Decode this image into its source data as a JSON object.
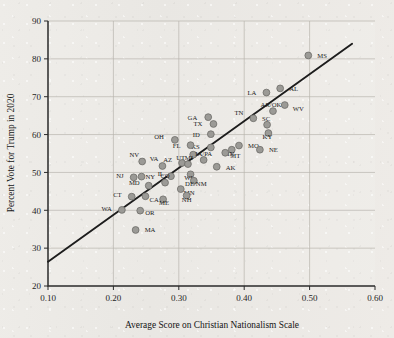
{
  "chart_data": {
    "type": "scatter",
    "title": "",
    "xlabel": "Average Score on Christian Nationalism Scale",
    "ylabel": "Percent Vote for Trump in 2020",
    "xlim": [
      0.1,
      0.6
    ],
    "ylim": [
      20,
      90
    ],
    "xticks": [
      "0.10",
      "0.20",
      "0.30",
      "0.40",
      "0.50",
      "0.60"
    ],
    "xtick_values": [
      0.1,
      0.2,
      0.3,
      0.4,
      0.5,
      0.6
    ],
    "yticks": [
      "20",
      "30",
      "40",
      "50",
      "60",
      "70",
      "80",
      "90"
    ],
    "ytick_values": [
      20,
      30,
      40,
      50,
      60,
      70,
      80,
      90
    ],
    "grid": true,
    "legend": "none",
    "marker_color": "#9b9a96",
    "marker_edge_color": "#6d6c68",
    "trendline": {
      "label": "linear fit",
      "color": "#1d1d1d",
      "x_start": 0.1,
      "y_start": 26.4,
      "x_end": 0.565,
      "y_end": 84.0
    },
    "points": [
      {
        "label": "MS",
        "x": 0.498,
        "y": 80.9,
        "lx": 9,
        "ly": 2.5
      },
      {
        "label": "AL",
        "x": 0.455,
        "y": 72.2,
        "lx": 9,
        "ly": 2.5
      },
      {
        "label": "LA",
        "x": 0.434,
        "y": 71.1,
        "lx": -10,
        "ly": 2.5
      },
      {
        "label": "WV",
        "x": 0.462,
        "y": 67.8,
        "lx": 8,
        "ly": 5.5
      },
      {
        "label": "AR/OK",
        "x": 0.444,
        "y": 66.2,
        "lx": -2,
        "ly": -4.5
      },
      {
        "label": "TN",
        "x": 0.414,
        "y": 64.3,
        "lx": -10,
        "ly": -3.5
      },
      {
        "label": "SC",
        "x": 0.435,
        "y": 62.6,
        "lx": -1,
        "ly": -4.2
      },
      {
        "label": "KY",
        "x": 0.437,
        "y": 60.4,
        "lx": -1,
        "ly": 6.0
      },
      {
        "label": "GA",
        "x": 0.345,
        "y": 64.6,
        "lx": -11,
        "ly": 2.5
      },
      {
        "label": "TX",
        "x": 0.353,
        "y": 62.8,
        "lx": -11,
        "ly": 2.5
      },
      {
        "label": "ID",
        "x": 0.349,
        "y": 60.1,
        "lx": -11,
        "ly": 2.5
      },
      {
        "label": "KS",
        "x": 0.349,
        "y": 56.6,
        "lx": -11,
        "ly": 2.0
      },
      {
        "label": "MO",
        "x": 0.392,
        "y": 57.1,
        "lx": 9,
        "ly": 2.5
      },
      {
        "label": "IN",
        "x": 0.381,
        "y": 56.0,
        "lx": -1,
        "ly": 6.5
      },
      {
        "label": "NE",
        "x": 0.424,
        "y": 56.0,
        "lx": 9,
        "ly": 2.5
      },
      {
        "label": "MT",
        "x": 0.371,
        "y": 55.2,
        "lx": 5,
        "ly": 5.6
      },
      {
        "label": "FL",
        "x": 0.318,
        "y": 57.2,
        "lx": -10,
        "ly": 2.5
      },
      {
        "label": "OH",
        "x": 0.294,
        "y": 58.6,
        "lx": -11,
        "ly": -0.5
      },
      {
        "label": "UT",
        "x": 0.322,
        "y": 54.7,
        "lx": -8,
        "ly": 5.8
      },
      {
        "label": "IA/PA",
        "x": 0.338,
        "y": 53.3,
        "lx": 0,
        "ly": -4.0
      },
      {
        "label": "AK",
        "x": 0.358,
        "y": 51.5,
        "lx": 9,
        "ly": 3.5
      },
      {
        "label": "AZ",
        "x": 0.305,
        "y": 52.5,
        "lx": -10,
        "ly": -1.0
      },
      {
        "label": "MI",
        "x": 0.314,
        "y": 52.2,
        "lx": 1,
        "ly": -4.0
      },
      {
        "label": "VA",
        "x": 0.275,
        "y": 51.7,
        "lx": -4,
        "ly": -4.5
      },
      {
        "label": "NV",
        "x": 0.244,
        "y": 52.9,
        "lx": -3,
        "ly": -4.5
      },
      {
        "label": "WI",
        "x": 0.318,
        "y": 49.5,
        "lx": -2,
        "ly": 5.8
      },
      {
        "label": "DE/NM",
        "x": 0.323,
        "y": 47.8,
        "lx": 2,
        "ly": 5.6
      },
      {
        "label": "IL",
        "x": 0.288,
        "y": 49.0,
        "lx": -7,
        "ly": -0.5
      },
      {
        "label": "NY",
        "x": 0.243,
        "y": 48.9,
        "lx": 4,
        "ly": 2.0
      },
      {
        "label": "NJ",
        "x": 0.231,
        "y": 48.7,
        "lx": -10,
        "ly": 0.5
      },
      {
        "label": "CO",
        "x": 0.279,
        "y": 47.3,
        "lx": 0,
        "ly": -4.2
      },
      {
        "label": "MN",
        "x": 0.303,
        "y": 45.6,
        "lx": 3,
        "ly": 5.8
      },
      {
        "label": "MD",
        "x": 0.254,
        "y": 46.5,
        "lx": -9,
        "ly": -0.5
      },
      {
        "label": "NH",
        "x": 0.312,
        "y": 43.9,
        "lx": 0,
        "ly": 6.0
      },
      {
        "label": "CA",
        "x": 0.249,
        "y": 43.7,
        "lx": 4,
        "ly": 5.6
      },
      {
        "label": "CT",
        "x": 0.228,
        "y": 43.6,
        "lx": -10,
        "ly": 0.5
      },
      {
        "label": "ME",
        "x": 0.276,
        "y": 42.9,
        "lx": 1,
        "ly": 6.0
      },
      {
        "label": "WA",
        "x": 0.213,
        "y": 40.1,
        "lx": -10,
        "ly": 1.0
      },
      {
        "label": "OR",
        "x": 0.241,
        "y": 39.9,
        "lx": 5,
        "ly": 4.6
      },
      {
        "label": "MA",
        "x": 0.234,
        "y": 34.8,
        "lx": 9,
        "ly": 2.5
      }
    ]
  }
}
